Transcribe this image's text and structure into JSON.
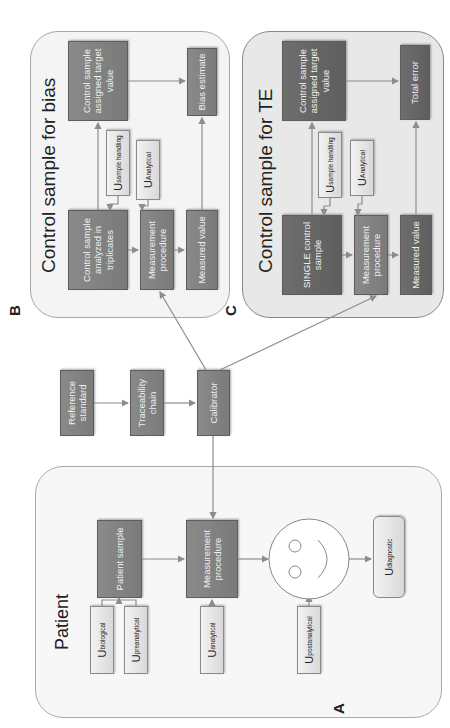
{
  "figure": {
    "orientation": "rotated 90 degrees counter-clockwise",
    "panels": {
      "A": {
        "label": "A",
        "title": "Patient",
        "boxes": {
          "patient_sample": "Patient sample",
          "measurement_procedure": "Measurement procedure"
        },
        "uncertainties": {
          "biological": {
            "main": "U",
            "sub": "biological"
          },
          "preanalytical": {
            "main": "U",
            "sub": "preanalytical"
          },
          "analytical": {
            "main": "U",
            "sub": "analytical"
          },
          "postanalytical": {
            "main": "U",
            "sub": "postanalytical"
          },
          "diagnostic": {
            "main": "U",
            "sub": "diagnostic"
          }
        },
        "smiley": "patient-outcome-face"
      },
      "B": {
        "label": "B",
        "title": "Control sample for bias",
        "boxes": {
          "control_sample": "Control sample analyzed in triplicates",
          "measurement_procedure": "Measurement procedure",
          "measured_value": "Measured value",
          "target_value": "Control sample assigned target value",
          "bias_estimate": "Bias estimate"
        },
        "uncertainties": {
          "sample_handling": {
            "main": "U",
            "sub": "sample handling"
          },
          "analytical": {
            "main": "U",
            "sub": "Analytical"
          }
        }
      },
      "C": {
        "label": "C",
        "title": "Control sample for TE",
        "boxes": {
          "control_sample": "SINGLE control sample",
          "measurement_procedure": "Measurement procedure",
          "measured_value": "Measured value",
          "target_value": "Control sample assigned target value",
          "total_error": "Total error"
        },
        "uncertainties": {
          "sample_handling": {
            "main": "U",
            "sub": "sample handling"
          },
          "analytical": {
            "main": "U",
            "sub": "Analytical"
          }
        }
      }
    },
    "traceability": {
      "reference_standard": "Reference standard",
      "traceability_chain": "Traceability chain",
      "calibrator": "Calibrator"
    },
    "colors": {
      "process_box": "#7f7f7f",
      "uncertainty_box": "#e6e6e6",
      "panel_border": "#a8a8a8",
      "arrow": "#8c8c8c"
    }
  }
}
